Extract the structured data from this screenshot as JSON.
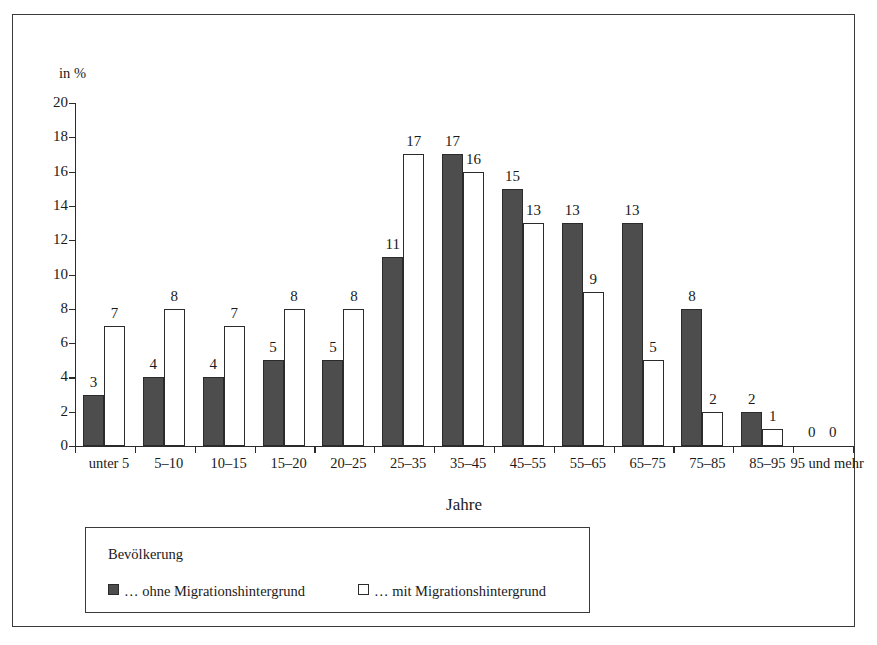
{
  "axis": {
    "unit_label": "in %",
    "x_title": "Jahre",
    "y_ticks": [
      "0",
      "2",
      "4",
      "6",
      "8",
      "10",
      "12",
      "14",
      "16",
      "18",
      "20"
    ]
  },
  "legend": {
    "title": "Bevölkerung",
    "entries": [
      {
        "label": "… ohne Migrationshintergrund",
        "swatch": "dark-filled-square",
        "color": "#4d4d4d"
      },
      {
        "label": "… mit Migrationshintergrund",
        "swatch": "white-outline-square",
        "color": "#ffffff"
      }
    ]
  },
  "chart_data": {
    "type": "bar",
    "title": "",
    "xlabel": "Jahre",
    "ylabel": "in %",
    "ylim": [
      0,
      20
    ],
    "ytick_step": 2,
    "grid": false,
    "legend_position": "bottom-left",
    "categories": [
      "unter 5",
      "5–10",
      "10–15",
      "15–20",
      "20–25",
      "25–35",
      "35–45",
      "45–55",
      "55–65",
      "65–75",
      "75–85",
      "85–95",
      "95 und mehr"
    ],
    "series": [
      {
        "name": "… ohne Migrationshintergrund",
        "color": "#4d4d4d",
        "values": [
          3,
          4,
          4,
          5,
          5,
          11,
          17,
          15,
          13,
          13,
          8,
          2,
          0
        ]
      },
      {
        "name": "… mit Migrationshintergrund",
        "color": "#ffffff",
        "values": [
          7,
          8,
          7,
          8,
          8,
          17,
          16,
          13,
          9,
          5,
          2,
          1,
          0
        ]
      }
    ]
  }
}
